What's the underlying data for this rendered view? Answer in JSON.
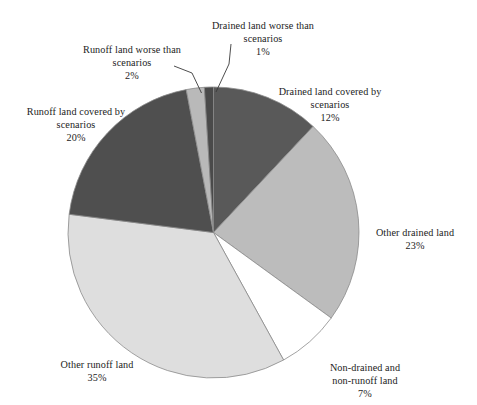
{
  "chart_data": {
    "type": "pie",
    "title": "",
    "subtitle": "",
    "xlabel": "",
    "ylabel": "",
    "legend_position": "none",
    "grid": false,
    "unit": "%",
    "total": 100,
    "start_angle_deg": 0,
    "direction": "clockwise",
    "categories": [
      "Drained land covered by scenarios",
      "Other drained land",
      "Non-drained and non-runoff  land",
      "Other runoff land",
      "Runoff land covered by scenarios",
      "Runoff land worse than scenarios",
      "Drained land worse than scenarios"
    ],
    "values": [
      12,
      23,
      7,
      35,
      20,
      2,
      1
    ],
    "colors": [
      "#595959",
      "#bcbcbc",
      "#ffffff",
      "#dedede",
      "#4f4f4f",
      "#b9b9b9",
      "#4a4a4a"
    ],
    "slices": [
      {
        "name": "drained-land-covered-by-scenarios",
        "label": "Drained land covered by\nscenarios",
        "value": 12,
        "percent_text": "12%",
        "color": "#595959"
      },
      {
        "name": "other-drained-land",
        "label": "Other drained land",
        "value": 23,
        "percent_text": "23%",
        "color": "#bcbcbc"
      },
      {
        "name": "non-drained-and-non-runoff-land",
        "label": "Non-drained and\nnon-runoff  land",
        "value": 7,
        "percent_text": "7%",
        "color": "#ffffff"
      },
      {
        "name": "other-runoff-land",
        "label": "Other runoff land",
        "value": 35,
        "percent_text": "35%",
        "color": "#dedede"
      },
      {
        "name": "runoff-land-covered-by-scenarios",
        "label": "Runoff land covered by\nscenarios",
        "value": 20,
        "percent_text": "20%",
        "color": "#4f4f4f"
      },
      {
        "name": "runoff-land-worse-than-scenarios",
        "label": "Runoff land worse than\nscenarios",
        "value": 2,
        "percent_text": "2%",
        "color": "#b9b9b9"
      },
      {
        "name": "drained-land-worse-than-scenarios",
        "label": "Drained land worse than\nscenarios",
        "value": 1,
        "percent_text": "1%",
        "color": "#4a4a4a"
      }
    ]
  },
  "labels": {
    "drained_worse": {
      "text": "Drained land worse than\nscenarios",
      "percent": "1%"
    },
    "runoff_worse": {
      "text": "Runoff land worse than\nscenarios",
      "percent": "2%"
    },
    "runoff_covered": {
      "text": "Runoff land covered by\nscenarios",
      "percent": "20%"
    },
    "drained_covered": {
      "text": "Drained land covered by\nscenarios",
      "percent": "12%"
    },
    "other_drained": {
      "text": "Other drained land",
      "percent": "23%"
    },
    "non_drained": {
      "text": "Non-drained and\nnon-runoff  land",
      "percent": "7%"
    },
    "other_runoff": {
      "text": "Other runoff land",
      "percent": "35%"
    }
  }
}
